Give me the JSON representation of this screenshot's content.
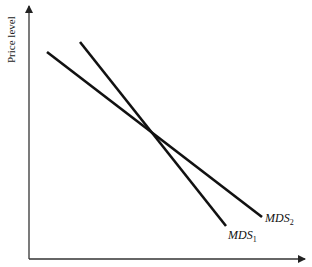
{
  "diagram": {
    "y_axis_label": "Price level",
    "x_axis_label": "",
    "curves": [
      {
        "name": "MDS",
        "subscript": "1",
        "from": [
          80,
          42
        ],
        "to": [
          226,
          226
        ]
      },
      {
        "name": "MDS",
        "subscript": "2",
        "from": [
          47,
          52
        ],
        "to": [
          262,
          217
        ]
      }
    ],
    "intersection": [
      156,
      131
    ],
    "colors": {
      "line": "#111111",
      "axis": "#333333",
      "background": "#ffffff"
    }
  }
}
